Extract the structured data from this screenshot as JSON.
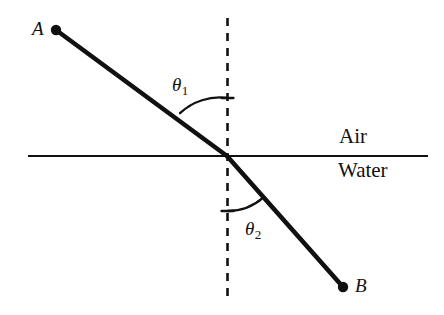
{
  "figure": {
    "kind": "refraction-diagram",
    "background_color": "#ffffff",
    "stroke_color": "#111111",
    "points": {
      "a": {
        "label": "A",
        "x": 56,
        "y": 30
      },
      "b": {
        "label": "B",
        "x": 343,
        "y": 287
      },
      "incidence": {
        "x": 227,
        "y": 156
      }
    },
    "normal_line": {
      "label": "normal",
      "x": 227,
      "y_top": 18,
      "y_bottom": 299,
      "style": "dashed"
    },
    "interface_line": {
      "label": "air-water-interface",
      "x_start": 28,
      "x_end": 428,
      "y": 156,
      "style": "solid"
    },
    "media": {
      "upper": "Air",
      "lower": "Water"
    },
    "angles": {
      "incidence": {
        "label": "θ",
        "subscript": "1",
        "arc_radius": 58,
        "value_deg": 54
      },
      "refraction": {
        "label": "θ",
        "subscript": "2",
        "arc_radius": 55,
        "value_deg": 41
      }
    },
    "rays": {
      "incident": {
        "label": "incident-ray",
        "from": "A",
        "to": "incidence"
      },
      "refracted": {
        "label": "refracted-ray",
        "from": "incidence",
        "to": "B"
      }
    }
  }
}
